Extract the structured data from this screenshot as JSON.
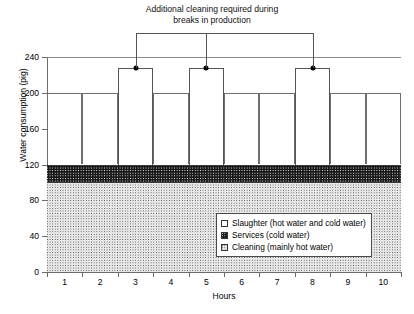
{
  "chart_data": {
    "type": "bar",
    "title": "",
    "annotation": "Additional cleaning required during\nbreaks in production",
    "xlabel": "Hours",
    "ylabel": "Water consumption (pig)",
    "categories": [
      "1",
      "2",
      "3",
      "4",
      "5",
      "6",
      "7",
      "8",
      "9",
      "10"
    ],
    "ylim": [
      0,
      240
    ],
    "yticks": [
      0,
      40,
      80,
      120,
      160,
      200,
      240
    ],
    "ytick_labels": [
      "0",
      "40",
      "80",
      "120",
      "160",
      "200",
      "240"
    ],
    "grid": true,
    "gridlines": [
      200,
      240
    ],
    "legend_position": "inside-lower-right",
    "stacked": true,
    "series": [
      {
        "name": "Cleaning (mainly hot water)",
        "pattern": "light-dotted",
        "base": 0,
        "values": [
          100,
          100,
          100,
          100,
          100,
          100,
          100,
          100,
          100,
          100
        ]
      },
      {
        "name": "Services (cold water)",
        "pattern": "dark-cross-hatch",
        "base": 100,
        "values": [
          20,
          20,
          20,
          20,
          20,
          20,
          20,
          20,
          20,
          20
        ]
      },
      {
        "name": "Slaughter (hot water and cold water)",
        "pattern": "white-outline",
        "base": 120,
        "values": [
          80,
          80,
          108,
          80,
          108,
          80,
          80,
          108,
          80,
          80
        ]
      }
    ],
    "totals": [
      200,
      200,
      228,
      200,
      228,
      200,
      200,
      228,
      200,
      200
    ],
    "peak_hours": [
      "3",
      "5",
      "8"
    ],
    "peak_value": 228,
    "baseline_value": 200,
    "markers": {
      "shape": "filled-circle",
      "color": "#000000",
      "at": [
        {
          "hour": "3",
          "value": 228
        },
        {
          "hour": "5",
          "value": 228
        },
        {
          "hour": "8",
          "value": 228
        }
      ]
    }
  },
  "legend": {
    "items": [
      {
        "label": "Slaughter (hot water and cold water)",
        "swatch": "slaughter-swatch"
      },
      {
        "label": "Services (cold water)",
        "swatch": "services-swatch"
      },
      {
        "label": "Cleaning (mainly hot water)",
        "swatch": "cleaning-swatch"
      }
    ]
  },
  "colors": {
    "axis": "#6b6b6b",
    "grid": "#8d8d8d",
    "bar_outline": "#6f6f6f",
    "services_fill": "#1a1a1a",
    "cleaning_fill": "#e8e8e8",
    "marker": "#000000"
  }
}
